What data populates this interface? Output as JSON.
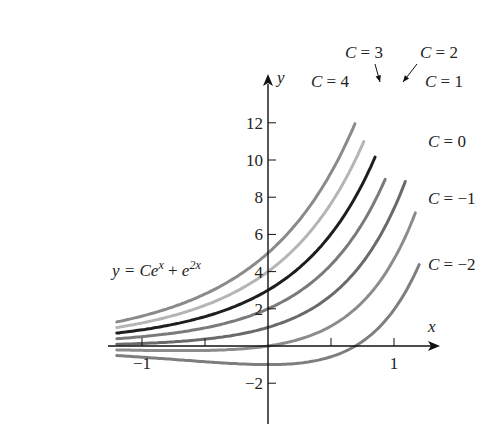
{
  "chart_data": {
    "type": "line",
    "title": "",
    "equation": "y = Ce^x + e^{2x}",
    "equation_label": {
      "lhs": "y = C",
      "e1": "e",
      "sup1": "x",
      "plus": " + ",
      "e2": "e",
      "sup2": "2x"
    },
    "xlabel": "x",
    "ylabel": "y",
    "xlim": [
      -1.2,
      1.35
    ],
    "ylim": [
      -2.5,
      14.5
    ],
    "x_ticks": [
      -1,
      -0.5,
      0.5,
      1
    ],
    "x_tick_labels": [
      {
        "value": -1,
        "label": "−1"
      },
      {
        "value": 1,
        "label": "1"
      }
    ],
    "y_ticks": [
      -2,
      2,
      4,
      6,
      8,
      10,
      12
    ],
    "y_tick_labels": [
      {
        "value": -2,
        "label": "−2"
      },
      {
        "value": 2,
        "label": "2"
      },
      {
        "value": 4,
        "label": "4"
      },
      {
        "value": 6,
        "label": "6"
      },
      {
        "value": 8,
        "label": "8"
      },
      {
        "value": 10,
        "label": "10"
      },
      {
        "value": 12,
        "label": "12"
      }
    ],
    "grid": false,
    "series": [
      {
        "name": "C = 4",
        "C": 4,
        "x_end": 0.69,
        "color": "#8a8a8a"
      },
      {
        "name": "C = 3",
        "C": 3,
        "x_end": 0.76,
        "color": "#b5b5b5"
      },
      {
        "name": "C = 2",
        "C": 2,
        "x_end": 0.85,
        "color": "#1e1e1e"
      },
      {
        "name": "C = 1",
        "C": 1,
        "x_end": 0.93,
        "color": "#7a7a7a"
      },
      {
        "name": "C = 0",
        "C": 0,
        "x_end": 1.09,
        "color": "#6a6a6a"
      },
      {
        "name": "C = −1",
        "C": -1,
        "x_end": 1.17,
        "color": "#8c8c8c"
      },
      {
        "name": "C = −2",
        "C": -2,
        "x_end": 1.2,
        "color": "#7e7e7e"
      }
    ],
    "annotations": [
      {
        "text": "C = 4",
        "x": 311,
        "y": 87
      },
      {
        "text": "C = 3",
        "x": 345,
        "y": 58,
        "arrow_to": [
          380,
          82
        ]
      },
      {
        "text": "C = 2",
        "x": 420,
        "y": 58,
        "arrow_to": [
          403,
          82
        ]
      },
      {
        "text": "C = 1",
        "x": 425,
        "y": 87
      },
      {
        "text": "C = 0",
        "x": 428,
        "y": 147
      },
      {
        "text": "C = −1",
        "x": 428,
        "y": 204
      },
      {
        "text": "C = −2",
        "x": 428,
        "y": 270
      }
    ]
  },
  "caption_fragment": "(c)"
}
